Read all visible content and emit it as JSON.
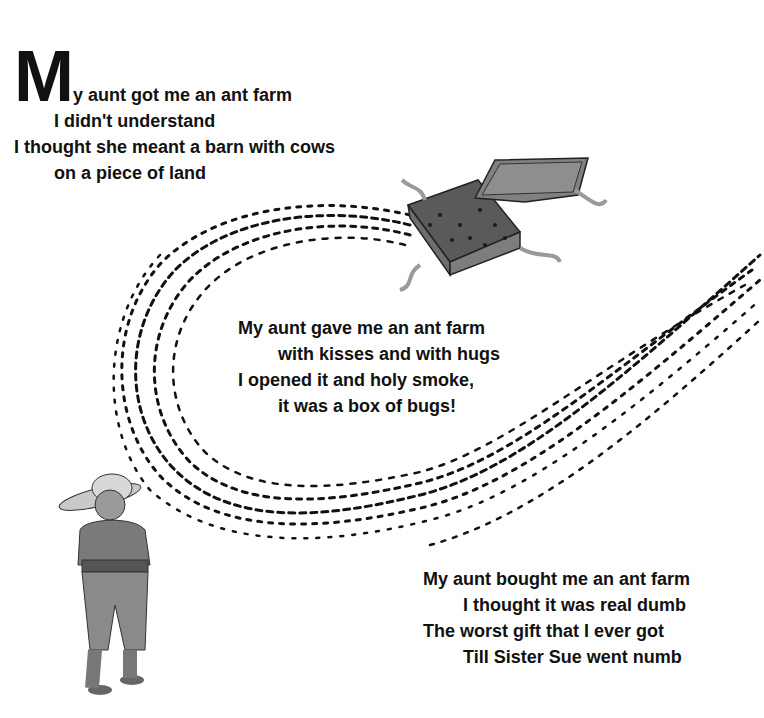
{
  "poem": {
    "stanza1": {
      "drop_cap": "M",
      "lines": [
        "y aunt got me an ant farm",
        "I didn't understand",
        "I thought she meant a barn with cows",
        "on a piece of land"
      ]
    },
    "stanza2": {
      "lines": [
        "My aunt gave me an ant farm",
        "with kisses and with hugs",
        "I opened it and holy smoke,",
        "it was a box of bugs!"
      ]
    },
    "stanza3": {
      "lines": [
        "My aunt bought me an ant farm",
        "I thought it was real dumb",
        "The worst gift that I ever got",
        "Till Sister Sue went numb"
      ]
    }
  },
  "illustration": {
    "elements": [
      "open-gift-box",
      "box-lid",
      "ribbon",
      "ant-trail",
      "aunt-figure"
    ],
    "colors": {
      "ink": "#111111",
      "box": "#6b6b6b",
      "lid": "#7a7a7a",
      "figure": "#8a8a8a"
    }
  }
}
